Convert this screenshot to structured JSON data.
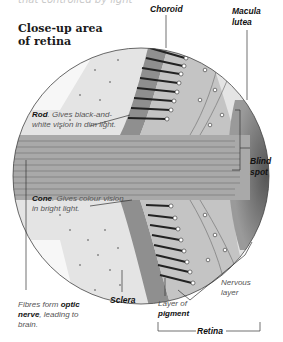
{
  "header": {
    "cut_text": "that controlled by light",
    "title": "Close-up area of retina"
  },
  "labels": {
    "choroid": "Choroid",
    "macula_lutea": "Macula lutea",
    "rod_term": "Rod",
    "rod_desc": ". Gives black-and-white vision in dim light.",
    "cone_term": "Cone",
    "cone_desc": ". Gives colour vision in bright light.",
    "blind_spot": "Blind spot",
    "fibres_prefix": "Fibres form ",
    "fibres_term": "optic nerve",
    "fibres_suffix": ", leading to brain.",
    "sclera": "Sclera",
    "pigment_prefix": "Layer of",
    "pigment_term": "pigment",
    "nervous_layer": "Nervous layer",
    "retina": "Retina"
  },
  "colors": {
    "sclera_fill": "#e4e4e4",
    "choroid_fill": "#8f8f8f",
    "retina_fill": "#bdbdbd",
    "blind_spot_fill": "#6e6e6e",
    "fibre_fill": "#a9a9a9",
    "outline": "#444444"
  }
}
